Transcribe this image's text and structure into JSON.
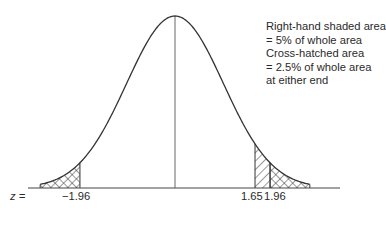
{
  "figure": {
    "annotation": {
      "lines": [
        "Right-hand shaded area",
        "= 5% of whole area",
        "Cross-hatched area",
        "= 2.5% of whole area",
        "at either end"
      ]
    },
    "axis": {
      "variable_label": "z =",
      "ticks": [
        {
          "value": -1.96,
          "label": "−1.96"
        },
        {
          "value": 1.65,
          "label": "1.65"
        },
        {
          "value": 1.96,
          "label": "1.96"
        }
      ]
    },
    "regions": [
      {
        "name": "left-tail",
        "from": "-inf",
        "to": -1.96,
        "fill": "cross-hatched",
        "area_pct": 2.5
      },
      {
        "name": "right-single-hatch",
        "from": 1.65,
        "to": 1.96,
        "fill": "diagonal-hatched"
      },
      {
        "name": "right-tail",
        "from": 1.96,
        "to": "inf",
        "fill": "cross-hatched",
        "area_pct": 2.5
      }
    ],
    "colors": {
      "line": "#333333",
      "background": "#ffffff"
    }
  }
}
